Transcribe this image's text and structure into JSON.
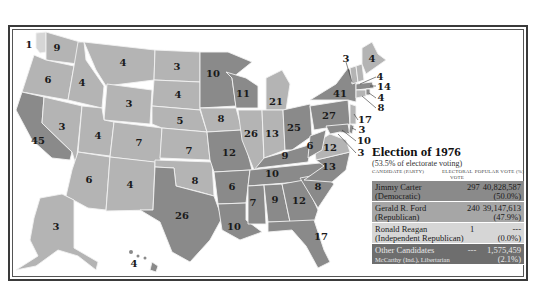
{
  "colors": {
    "democratic": "#8a8a8a",
    "republican": "#b4b4b4",
    "independent_republican": "#d6d6d6",
    "other": "#6e6e6e",
    "border": "#f2f2f2",
    "frame": "#3a3a3a"
  },
  "legend": {
    "title": "Election of 1976",
    "subtitle": "(53.5% of electorate voting)",
    "headers": {
      "candidate": "CANDIDATE (PARTY)",
      "electoral": "ELECTORAL VOTE",
      "popular": "POPULAR VOTE (%)"
    },
    "rows": [
      {
        "name": "Jimmy Carter",
        "party": "(Democratic)",
        "electoral": "297",
        "popular": "40,828,587",
        "percent": "(50.0%)"
      },
      {
        "name": "Gerald R. Ford",
        "party": "(Republican)",
        "electoral": "240",
        "popular": "39,147,613",
        "percent": "(47.9%)"
      },
      {
        "name": "Ronald Reagan",
        "party": "(Independent Republican)",
        "electoral": "1",
        "popular": "---",
        "percent": "(0.0%)"
      },
      {
        "name": "Other Candidates",
        "party": "McCarthy (Ind.), Libertarian",
        "electoral": "---",
        "popular": "1,575,459",
        "percent": "(2.1%)"
      }
    ]
  },
  "states": {
    "WA": "9",
    "WA_split": "1",
    "OR": "6",
    "CA": "45",
    "ID": "4",
    "NV": "3",
    "MT": "4",
    "WY": "3",
    "UT": "4",
    "AZ": "6",
    "CO": "7",
    "NM": "4",
    "ND": "3",
    "SD": "4",
    "NE": "5",
    "KS": "7",
    "OK": "8",
    "TX": "26",
    "MN": "10",
    "IA": "8",
    "MO": "12",
    "AR": "6",
    "LA": "10",
    "WI": "11",
    "IL": "26",
    "MI": "21",
    "IN": "13",
    "OH": "25",
    "KY": "9",
    "TN": "10",
    "MS": "7",
    "AL": "9",
    "GA": "12",
    "FL": "17",
    "SC": "8",
    "NC": "13",
    "VA": "12",
    "WV": "6",
    "PA": "27",
    "NY": "41",
    "VT": "3",
    "NH": "4",
    "ME": "4",
    "MA": "14",
    "RI": "4",
    "CT": "8",
    "NJ": "17",
    "DE": "3",
    "MD": "10",
    "DC": "3",
    "AK": "3",
    "HI": "4"
  }
}
